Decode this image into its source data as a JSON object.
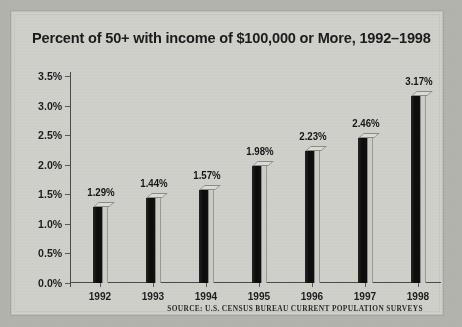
{
  "chart_data": {
    "type": "bar",
    "title": "Percent of 50+ with income of $100,000 or More, 1992–1998",
    "xlabel": "",
    "ylabel": "",
    "categories": [
      "1992",
      "1993",
      "1994",
      "1995",
      "1996",
      "1997",
      "1998"
    ],
    "values": [
      1.29,
      1.44,
      1.57,
      1.98,
      2.23,
      2.46,
      3.17
    ],
    "data_labels": [
      "1.29%",
      "1.44%",
      "1.57%",
      "1.98%",
      "2.23%",
      "2.46%",
      "3.17%"
    ],
    "ylim": [
      0,
      3.5
    ],
    "ytick_values": [
      0.0,
      0.5,
      1.0,
      1.5,
      2.0,
      2.5,
      3.0,
      3.5
    ],
    "ytick_labels": [
      "0.0%",
      "0.5%",
      "1.0%",
      "1.5%",
      "2.0%",
      "2.5%",
      "3.0%",
      "3.5%"
    ],
    "grid": false,
    "legend": "none",
    "bar_style": "3d-column",
    "colors": {
      "bar_front": "#141414",
      "bar_side": "#cfcfca",
      "bar_top": "#deded9",
      "axis": "#4a4a48",
      "text": "#1b1b1b",
      "panel_background": "#d2d2cd",
      "outer_background": "#b5b5b0"
    }
  },
  "source": {
    "note": "SOURCE: U.S. CENSUS BUREAU CURRENT POPULATION SURVEYS"
  }
}
